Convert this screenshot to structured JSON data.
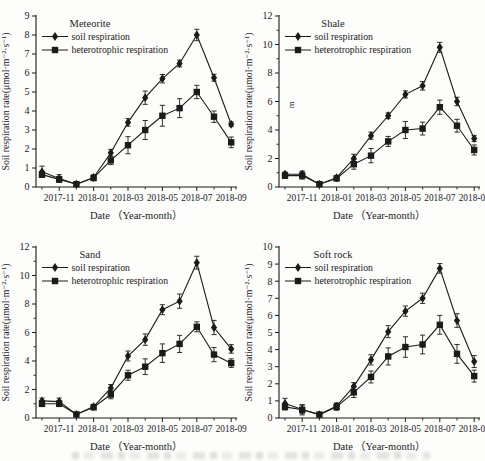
{
  "figure": {
    "x_axis_label": "Date （Year-month）",
    "y_axis_label": "Soil respiration rate(μmol·m⁻²·s⁻¹)",
    "legend_entries": [
      "soil respiration",
      "heterotrophic respiration"
    ],
    "ink_color": "#1b1b1b",
    "background_color": "#fdfdfc",
    "x_tick_labels": [
      "2017-11",
      "2018-01",
      "2018-03",
      "2018-05",
      "2018-07",
      "2018-09"
    ],
    "artifacts": {
      "shale_stray_character": "m",
      "bottom_edge": "faint cropped illegible caption line"
    }
  },
  "chart_data": [
    {
      "type": "line",
      "title": "Meteorite",
      "xlabel": "Date （Year-month）",
      "ylabel": "Soil respiration rate(μmol·m⁻²·s⁻¹)",
      "x": [
        "2017-10",
        "2017-11",
        "2017-12",
        "2018-01",
        "2018-02",
        "2018-03",
        "2018-04",
        "2018-05",
        "2018-06",
        "2018-07",
        "2018-08",
        "2018-09"
      ],
      "x_tick_labels": [
        "2017-11",
        "2018-01",
        "2018-03",
        "2018-05",
        "2018-07",
        "2018-09"
      ],
      "ylim": [
        0,
        9
      ],
      "ytick_step": 1,
      "y_minor_ticks": false,
      "grid": false,
      "legend_position": "top-left",
      "series": [
        {
          "name": "soil respiration",
          "marker": "diamond",
          "values": [
            0.8,
            0.45,
            0.15,
            0.5,
            1.8,
            3.4,
            4.7,
            5.7,
            6.5,
            8.0,
            5.75,
            3.3
          ],
          "errors": [
            0.3,
            0.2,
            0.07,
            0.12,
            0.18,
            0.2,
            0.35,
            0.22,
            0.18,
            0.3,
            0.18,
            0.12
          ]
        },
        {
          "name": "heterotrophic respiration",
          "marker": "square",
          "values": [
            0.65,
            0.4,
            0.15,
            0.48,
            1.4,
            2.2,
            3.0,
            3.75,
            4.15,
            5.0,
            3.7,
            2.35
          ],
          "errors": [
            0.15,
            0.15,
            0.07,
            0.15,
            0.22,
            0.45,
            0.5,
            0.55,
            0.5,
            0.35,
            0.3,
            0.28
          ]
        }
      ]
    },
    {
      "type": "line",
      "title": "Shale",
      "xlabel": "Date （Year-month）",
      "ylabel": "Soil respiration rate(μmol·m⁻²·s⁻¹)",
      "x": [
        "2017-10",
        "2017-11",
        "2017-12",
        "2018-01",
        "2018-02",
        "2018-03",
        "2018-04",
        "2018-05",
        "2018-06",
        "2018-07",
        "2018-08",
        "2018-09"
      ],
      "x_tick_labels": [
        "2017-11",
        "2018-01",
        "2018-03",
        "2018-05",
        "2018-07",
        "2018-09"
      ],
      "ylim": [
        0,
        12
      ],
      "ytick_step": 2,
      "y_minor_ticks": true,
      "grid": false,
      "legend_position": "top-left",
      "stray_text": "m",
      "series": [
        {
          "name": "soil respiration",
          "marker": "diamond",
          "values": [
            0.9,
            0.9,
            0.2,
            0.65,
            2.0,
            3.6,
            5.0,
            6.5,
            7.1,
            9.8,
            6.0,
            3.4
          ],
          "errors": [
            0.15,
            0.22,
            0.07,
            0.12,
            0.3,
            0.25,
            0.2,
            0.25,
            0.3,
            0.35,
            0.3,
            0.2
          ]
        },
        {
          "name": "heterotrophic respiration",
          "marker": "square",
          "values": [
            0.8,
            0.8,
            0.2,
            0.6,
            1.6,
            2.2,
            3.2,
            4.0,
            4.1,
            5.6,
            4.3,
            2.6
          ],
          "errors": [
            0.2,
            0.25,
            0.07,
            0.15,
            0.35,
            0.5,
            0.35,
            0.6,
            0.45,
            0.5,
            0.45,
            0.35
          ]
        }
      ]
    },
    {
      "type": "line",
      "title": "Sand",
      "xlabel": "Date （Year-month）",
      "ylabel": "Soil respiration rate(μmol·m⁻²·s⁻¹)",
      "x": [
        "2017-10",
        "2017-11",
        "2017-12",
        "2018-01",
        "2018-02",
        "2018-03",
        "2018-04",
        "2018-05",
        "2018-06",
        "2018-07",
        "2018-08",
        "2018-09"
      ],
      "x_tick_labels": [
        "2017-11",
        "2018-01",
        "2018-03",
        "2018-05",
        "2018-07",
        "2018-09"
      ],
      "ylim": [
        0,
        12
      ],
      "ytick_step": 2,
      "y_minor_ticks": true,
      "grid": false,
      "legend_position": "top-left",
      "series": [
        {
          "name": "soil respiration",
          "marker": "diamond",
          "values": [
            1.2,
            1.15,
            0.25,
            0.8,
            2.1,
            4.35,
            5.5,
            7.6,
            8.2,
            10.9,
            6.35,
            4.85
          ],
          "errors": [
            0.2,
            0.25,
            0.08,
            0.15,
            0.25,
            0.35,
            0.4,
            0.35,
            0.5,
            0.45,
            0.5,
            0.3
          ]
        },
        {
          "name": "heterotrophic respiration",
          "marker": "square",
          "values": [
            1.0,
            1.0,
            0.25,
            0.75,
            1.65,
            3.0,
            3.6,
            4.55,
            5.2,
            6.4,
            4.45,
            3.85
          ],
          "errors": [
            0.2,
            0.2,
            0.08,
            0.15,
            0.3,
            0.35,
            0.55,
            0.65,
            0.6,
            0.35,
            0.5,
            0.3
          ]
        }
      ]
    },
    {
      "type": "line",
      "title": "Soft rock",
      "xlabel": "Date （Year-month）",
      "ylabel": "Soil respiration rate(μmol·m⁻²·s⁻¹)",
      "x": [
        "2017-10",
        "2017-11",
        "2017-12",
        "2018-01",
        "2018-02",
        "2018-03",
        "2018-04",
        "2018-05",
        "2018-06",
        "2018-07",
        "2018-08",
        "2018-09"
      ],
      "x_tick_labels": [
        "2017-11",
        "2018-01",
        "2018-03",
        "2018-05",
        "2018-07",
        "2018-09"
      ],
      "ylim": [
        0,
        10
      ],
      "ytick_step": 1,
      "y_minor_ticks": false,
      "grid": false,
      "legend_position": "top-left",
      "series": [
        {
          "name": "soil respiration",
          "marker": "diamond",
          "values": [
            0.85,
            0.5,
            0.2,
            0.7,
            1.85,
            3.4,
            5.05,
            6.25,
            7.0,
            8.75,
            5.7,
            3.3
          ],
          "errors": [
            0.3,
            0.25,
            0.07,
            0.18,
            0.22,
            0.3,
            0.35,
            0.3,
            0.3,
            0.28,
            0.4,
            0.35
          ]
        },
        {
          "name": "heterotrophic respiration",
          "marker": "square",
          "values": [
            0.65,
            0.48,
            0.2,
            0.65,
            1.5,
            2.4,
            3.6,
            4.15,
            4.3,
            5.45,
            3.75,
            2.45
          ],
          "errors": [
            0.18,
            0.3,
            0.07,
            0.2,
            0.3,
            0.35,
            0.5,
            0.6,
            0.55,
            0.55,
            0.55,
            0.35
          ]
        }
      ]
    }
  ]
}
